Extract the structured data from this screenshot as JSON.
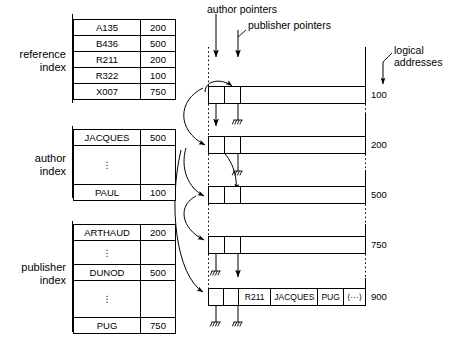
{
  "diagram": {
    "indexes": [
      {
        "id": "reference-index",
        "label": "reference\nindex",
        "rows": [
          {
            "key": "A135",
            "value": "200"
          },
          {
            "key": "B436",
            "value": "500"
          },
          {
            "key": "R211",
            "value": "200"
          },
          {
            "key": "R322",
            "value": "100"
          },
          {
            "key": "X007",
            "value": "750"
          }
        ]
      },
      {
        "id": "author-index",
        "label": "author\nindex",
        "rows": [
          {
            "key": "JACQUES",
            "value": "500"
          },
          {
            "key": "⋮",
            "value": "",
            "gap": true
          },
          {
            "key": "PAUL",
            "value": "100"
          }
        ]
      },
      {
        "id": "publisher-index",
        "label": "publisher\nindex",
        "rows": [
          {
            "key": "ARTHAUD",
            "value": "200"
          },
          {
            "key": "⋮",
            "value": "",
            "gap": true
          },
          {
            "key": "DUNOD",
            "value": "500"
          },
          {
            "key": "⋮",
            "value": "",
            "gap": true
          },
          {
            "key": "PUG",
            "value": "750"
          }
        ]
      }
    ],
    "pointer_labels": {
      "author": "author pointers",
      "publisher": "publisher pointers",
      "logical": "logical\naddresses"
    },
    "records": [
      {
        "address": "100",
        "cells": []
      },
      {
        "address": "200",
        "cells": []
      },
      {
        "address": "500",
        "cells": []
      },
      {
        "address": "750",
        "cells": []
      },
      {
        "address": "900",
        "cells": [
          "R211",
          "JACQUES",
          "PUG",
          "⟨···⟩"
        ]
      }
    ],
    "addresses": [
      "100",
      "200",
      "500",
      "750",
      "900"
    ]
  }
}
